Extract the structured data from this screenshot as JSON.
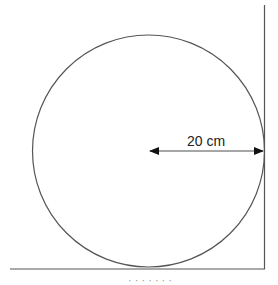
{
  "diagram": {
    "radius_label": "20 cm",
    "colors": {
      "stroke": "#555555",
      "arrow": "#111111",
      "text": "#222222"
    },
    "cropped_caption_fragment": "· ·  · ·  ·  ·  ·"
  }
}
